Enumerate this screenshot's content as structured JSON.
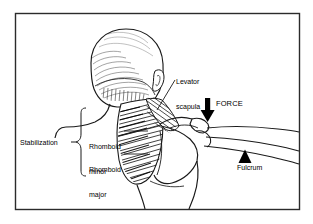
{
  "figure": {
    "frame_color": "#000000",
    "background_color": "#ffffff",
    "ink_color": "#000000"
  },
  "labels": {
    "levator_scapula_line1": "Levator",
    "levator_scapula_line2": "scapula",
    "force": "FORCE",
    "fulcrum": "Fulcrum",
    "stabilization": "Stabilization",
    "rhomboid_minor_line1": "Rhomboid",
    "rhomboid_minor_line2": "minor",
    "rhomboid_major_line1": "Rhomboid",
    "rhomboid_major_line2": "major"
  },
  "markers": {
    "force_arrow": "down-arrow-icon",
    "fulcrum_triangle": "up-triangle-icon",
    "stabilization_brace": "curly-brace-icon"
  }
}
